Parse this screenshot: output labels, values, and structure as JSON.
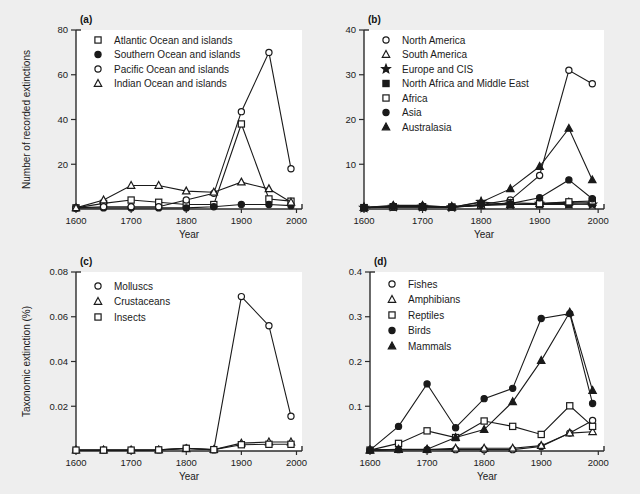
{
  "figure": {
    "background_color": "#eeeeee",
    "plot_background_color": "#ffffff",
    "ink_color": "#1a1a1a",
    "x_axis_label": "Year",
    "x_ticks": [
      1600,
      1700,
      1800,
      1900,
      2000
    ],
    "x_range": [
      1600,
      2010
    ]
  },
  "panels": {
    "a": {
      "letter": "(a)",
      "ylabel": "Number of recorded extinctions",
      "xlabel": "Year"
    },
    "b": {
      "letter": "(b)",
      "ylabel": "",
      "xlabel": "Year"
    },
    "c": {
      "letter": "(c)",
      "ylabel": "Taxonomic extinction (%)",
      "xlabel": "Year"
    },
    "d": {
      "letter": "(d)",
      "ylabel": "",
      "xlabel": "Year"
    }
  },
  "chart_data": [
    {
      "panel": "a",
      "type": "line",
      "title": "(a)",
      "xlabel": "Year",
      "ylabel": "Number of recorded extinctions",
      "x": [
        1600,
        1650,
        1700,
        1750,
        1800,
        1850,
        1900,
        1950,
        1990
      ],
      "xlim": [
        1600,
        2010
      ],
      "ylim": [
        0,
        80
      ],
      "yticks": [
        0,
        20,
        40,
        60,
        80
      ],
      "xticks": [
        1600,
        1700,
        1800,
        1900,
        2000
      ],
      "grid": false,
      "legend_position": "top-left-inside",
      "series": [
        {
          "name": "Atlantic Ocean and islands",
          "marker": "open-square",
          "values": [
            0.5,
            2.5,
            4.0,
            3.0,
            2.0,
            2.0,
            38.0,
            4.5,
            3.5
          ]
        },
        {
          "name": "Southern Ocean and islands",
          "marker": "filled-circle",
          "values": [
            0.5,
            0.5,
            0.5,
            0.5,
            0.5,
            1.0,
            2.0,
            2.0,
            1.5
          ]
        },
        {
          "name": "Pacific Ocean and islands",
          "marker": "open-circle",
          "values": [
            0.5,
            1.0,
            1.0,
            1.0,
            4.0,
            7.0,
            43.5,
            70.0,
            18.0
          ]
        },
        {
          "name": "Indian Ocean and islands",
          "marker": "open-triangle",
          "values": [
            0.5,
            4.0,
            10.5,
            10.5,
            8.0,
            7.5,
            12.0,
            9.0,
            3.0
          ]
        }
      ]
    },
    {
      "panel": "b",
      "type": "line",
      "title": "(b)",
      "xlabel": "Year",
      "ylabel": "",
      "x": [
        1600,
        1650,
        1700,
        1750,
        1800,
        1850,
        1900,
        1950,
        1990
      ],
      "xlim": [
        1600,
        2010
      ],
      "ylim": [
        0,
        40
      ],
      "yticks": [
        0,
        10,
        20,
        30,
        40
      ],
      "xticks": [
        1600,
        1700,
        1800,
        1900,
        2000
      ],
      "grid": false,
      "legend_position": "top-left-inside",
      "series": [
        {
          "name": "North America",
          "marker": "open-circle",
          "values": [
            0.3,
            0.6,
            0.6,
            0.4,
            1.0,
            2.0,
            7.5,
            31.0,
            28.0
          ]
        },
        {
          "name": "South America",
          "marker": "open-triangle",
          "values": [
            0.3,
            0.5,
            0.5,
            0.4,
            0.8,
            1.0,
            1.2,
            1.5,
            1.5
          ]
        },
        {
          "name": "Europe and CIS",
          "marker": "filled-star",
          "values": [
            0.3,
            0.5,
            0.5,
            0.4,
            1.6,
            1.0,
            1.2,
            1.2,
            1.0
          ]
        },
        {
          "name": "North Africa and Middle East",
          "marker": "filled-square",
          "values": [
            0.3,
            0.5,
            0.5,
            0.4,
            0.9,
            1.0,
            1.0,
            1.0,
            1.2
          ]
        },
        {
          "name": "Africa",
          "marker": "open-square",
          "values": [
            0.3,
            0.4,
            0.4,
            0.4,
            0.8,
            1.4,
            1.2,
            1.6,
            1.8
          ]
        },
        {
          "name": "Asia",
          "marker": "filled-circle",
          "values": [
            0.3,
            0.5,
            0.5,
            0.4,
            1.0,
            1.2,
            2.5,
            6.5,
            2.3
          ]
        },
        {
          "name": "Australasia",
          "marker": "filled-triangle",
          "values": [
            0.3,
            0.8,
            0.8,
            0.4,
            1.5,
            4.5,
            9.5,
            18.0,
            6.5
          ]
        }
      ]
    },
    {
      "panel": "c",
      "type": "line",
      "title": "(c)",
      "xlabel": "Year",
      "ylabel": "Taxonomic extinction (%)",
      "x": [
        1600,
        1650,
        1700,
        1750,
        1800,
        1850,
        1900,
        1950,
        1990
      ],
      "xlim": [
        1600,
        2010
      ],
      "ylim": [
        0,
        0.08
      ],
      "yticks": [
        0,
        0.02,
        0.04,
        0.06,
        0.08
      ],
      "xticks": [
        1600,
        1700,
        1800,
        1900,
        2000
      ],
      "grid": false,
      "legend_position": "top-left-inside",
      "series": [
        {
          "name": "Molluscs",
          "marker": "open-circle",
          "values": [
            0.0004,
            0.0004,
            0.0004,
            0.0005,
            0.0012,
            0.0005,
            0.069,
            0.056,
            0.0155
          ]
        },
        {
          "name": "Crustaceans",
          "marker": "open-triangle",
          "values": [
            0.0004,
            0.0004,
            0.0004,
            0.0005,
            0.001,
            0.0006,
            0.0035,
            0.004,
            0.004
          ]
        },
        {
          "name": "Insects",
          "marker": "open-square",
          "values": [
            0.0004,
            0.0004,
            0.0004,
            0.0005,
            0.0012,
            0.0006,
            0.0028,
            0.003,
            0.003
          ]
        }
      ]
    },
    {
      "panel": "d",
      "type": "line",
      "title": "(d)",
      "xlabel": "Year",
      "ylabel": "",
      "x": [
        1600,
        1650,
        1700,
        1750,
        1800,
        1850,
        1900,
        1950,
        1990
      ],
      "xlim": [
        1600,
        2010
      ],
      "ylim": [
        0,
        0.4
      ],
      "yticks": [
        0,
        0.1,
        0.2,
        0.3,
        0.4
      ],
      "xticks": [
        1600,
        1700,
        1800,
        1900,
        2000
      ],
      "grid": false,
      "legend_position": "top-left-inside",
      "series": [
        {
          "name": "Fishes",
          "marker": "open-circle",
          "values": [
            0.002,
            0.003,
            0.003,
            0.003,
            0.003,
            0.003,
            0.01,
            0.04,
            0.068
          ]
        },
        {
          "name": "Amphibians",
          "marker": "open-triangle",
          "values": [
            0.002,
            0.003,
            0.003,
            0.006,
            0.006,
            0.006,
            0.012,
            0.04,
            0.043
          ]
        },
        {
          "name": "Reptiles",
          "marker": "open-square",
          "values": [
            0.002,
            0.017,
            0.045,
            0.03,
            0.067,
            0.055,
            0.037,
            0.101,
            0.055
          ]
        },
        {
          "name": "Birds",
          "marker": "filled-circle",
          "values": [
            0.002,
            0.055,
            0.15,
            0.052,
            0.117,
            0.14,
            0.296,
            0.307,
            0.106
          ]
        },
        {
          "name": "Mammals",
          "marker": "filled-triangle",
          "values": [
            0.002,
            0.004,
            0.004,
            0.03,
            0.048,
            0.11,
            0.202,
            0.31,
            0.135
          ]
        }
      ]
    }
  ]
}
